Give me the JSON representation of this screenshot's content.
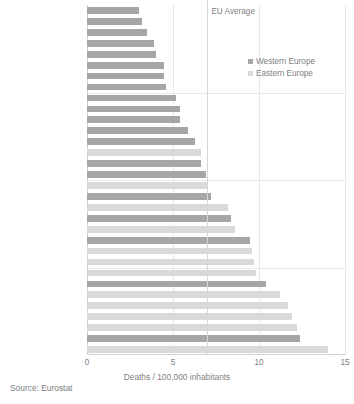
{
  "chart_data": {
    "type": "bar",
    "orientation": "horizontal",
    "title": "",
    "xlabel": "Deaths / 100,000 inhabitants",
    "ylabel": "",
    "xlim": [
      0,
      15
    ],
    "xticks": [
      0,
      5,
      10,
      15
    ],
    "xtick_labels": [
      "0",
      "5",
      "10",
      "15"
    ],
    "grid": true,
    "legend_position": "top-right",
    "legend": [
      "Western Europe",
      "Eastern Europe"
    ],
    "annotations": [
      {
        "label": "EU Average",
        "value": 7.0,
        "type": "vline"
      }
    ],
    "source": "Source: Eurostat",
    "series": [
      {
        "name": "Western Europe",
        "color": "#a6a6a6"
      },
      {
        "name": "Eastern Europe",
        "color": "#d9d9d9"
      }
    ],
    "categories": [
      "Sweden",
      "United Kingdom",
      "Malta",
      "Ireland",
      "Iceland",
      "Germany",
      "Switzerland",
      "Netherlands",
      "Luxembourg",
      "Spain",
      "Norway",
      "Denmark",
      "France",
      "FYR Macedonia",
      "Finland",
      "Austria",
      "Estonia",
      "Italy",
      "Slovenia",
      "Belgium",
      "Czech Republic",
      "Portugal",
      "Slovakia",
      "Bulgaria",
      "Hungary",
      "Cyprus",
      "Croatia",
      "Poland",
      "Lithuania",
      "Latvia",
      "Greece",
      "Romania"
    ],
    "values": [
      3.0,
      3.2,
      3.5,
      3.9,
      4.0,
      4.5,
      4.5,
      4.6,
      5.2,
      5.4,
      5.4,
      5.9,
      6.3,
      6.6,
      6.6,
      6.9,
      7.0,
      7.2,
      8.2,
      8.4,
      8.6,
      9.5,
      9.6,
      9.7,
      9.8,
      10.4,
      11.2,
      11.7,
      11.9,
      12.2,
      12.4,
      14.0
    ],
    "group": [
      "Western Europe",
      "Western Europe",
      "Western Europe",
      "Western Europe",
      "Western Europe",
      "Western Europe",
      "Western Europe",
      "Western Europe",
      "Western Europe",
      "Western Europe",
      "Western Europe",
      "Western Europe",
      "Western Europe",
      "Eastern Europe",
      "Western Europe",
      "Western Europe",
      "Eastern Europe",
      "Western Europe",
      "Eastern Europe",
      "Western Europe",
      "Eastern Europe",
      "Western Europe",
      "Eastern Europe",
      "Eastern Europe",
      "Eastern Europe",
      "Western Europe",
      "Eastern Europe",
      "Eastern Europe",
      "Eastern Europe",
      "Eastern Europe",
      "Western Europe",
      "Eastern Europe"
    ]
  },
  "colors": {
    "western": "#a6a6a6",
    "eastern": "#d9d9d9",
    "grid": "#e8e8e8",
    "axis": "#d0d0d0",
    "text": "#808080",
    "background": "#ffffff"
  }
}
